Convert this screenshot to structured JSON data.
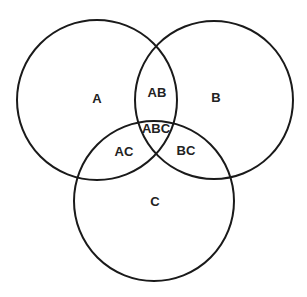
{
  "diagram": {
    "type": "venn",
    "stroke_color": "#1a1a1a",
    "circles": [
      {
        "name": "A",
        "cx": 97,
        "cy": 100,
        "r": 80
      },
      {
        "name": "B",
        "cx": 214,
        "cy": 100,
        "r": 79
      },
      {
        "name": "C",
        "cx": 154,
        "cy": 201,
        "r": 80
      }
    ],
    "regions": [
      {
        "id": "A",
        "label": "A",
        "x": 97,
        "y": 103
      },
      {
        "id": "B",
        "label": "B",
        "x": 216,
        "y": 102
      },
      {
        "id": "C",
        "label": "C",
        "x": 155,
        "y": 206
      },
      {
        "id": "AB",
        "label": "AB",
        "x": 157,
        "y": 97
      },
      {
        "id": "AC",
        "label": "AC",
        "x": 124,
        "y": 156
      },
      {
        "id": "BC",
        "label": "BC",
        "x": 186,
        "y": 155
      },
      {
        "id": "ABC",
        "label": "ABC",
        "x": 156,
        "y": 133
      }
    ]
  }
}
